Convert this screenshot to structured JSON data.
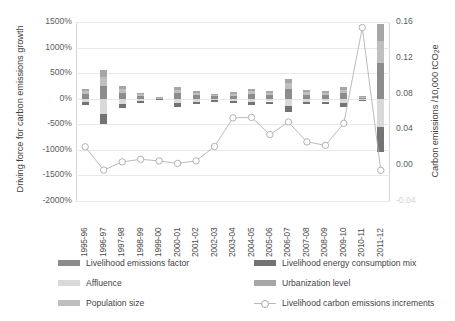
{
  "chart_data": {
    "type": "bar",
    "subtype": "stacked-bar-with-line",
    "title": "",
    "xlabel": "",
    "ylabel": "Driving force for carbon emissions growth",
    "y2label": "Carbon emissions /10,000 tCO2e",
    "grid": true,
    "legend_position": "bottom",
    "categories": [
      "1995-96",
      "1996-97",
      "1997-98",
      "1998-99",
      "1999-00",
      "2000-01",
      "2001-02",
      "2002-03",
      "2003-04",
      "2004-05",
      "2005-06",
      "2006-07",
      "2007-08",
      "2008-09",
      "2009-10",
      "2010-11",
      "2011-12"
    ],
    "ylim": [
      -2000,
      1500
    ],
    "yticks": [
      "-2000%",
      "-1500%",
      "-1000%",
      "-500%",
      "0%",
      "500%",
      "1000%",
      "1500%"
    ],
    "ytick_values": [
      -2000,
      -1500,
      -1000,
      -500,
      0,
      500,
      1000,
      1500
    ],
    "y2lim": [
      -0.04,
      0.16
    ],
    "y2ticks": [
      "-0.04",
      "0.00",
      "0.04",
      "0.08",
      "0.12",
      "0.16"
    ],
    "y2tick_values": [
      -0.04,
      0.0,
      0.04,
      0.08,
      0.12,
      0.16
    ],
    "series": [
      {
        "name": "Livelihood emissions factor",
        "type": "bar",
        "color": "#8c8c8c",
        "values": [
          90,
          250,
          120,
          55,
          15,
          120,
          70,
          45,
          60,
          95,
          75,
          190,
          80,
          75,
          110,
          25,
          700
        ]
      },
      {
        "name": "Affluence",
        "type": "bar",
        "color": "#d9d9d9",
        "values": [
          -70,
          -300,
          -95,
          -40,
          -10,
          -85,
          -60,
          -30,
          -45,
          -70,
          -55,
          -150,
          -60,
          -55,
          -85,
          -20,
          -560
        ]
      },
      {
        "name": "Population size",
        "type": "bar",
        "color": "#bfbfbf",
        "values": [
          55,
          180,
          70,
          30,
          8,
          60,
          45,
          25,
          35,
          50,
          40,
          110,
          45,
          40,
          65,
          15,
          420
        ]
      },
      {
        "name": "Livelihood energy consumption mix",
        "type": "bar",
        "color": "#737373",
        "values": [
          -60,
          -190,
          -80,
          -35,
          -9,
          -70,
          -50,
          -28,
          -40,
          -58,
          -45,
          -120,
          -50,
          -45,
          -70,
          -18,
          -480
        ]
      },
      {
        "name": "Urbanization level",
        "type": "bar",
        "color": "#a6a6a6",
        "values": [
          45,
          140,
          60,
          25,
          6,
          50,
          38,
          20,
          30,
          45,
          35,
          95,
          38,
          33,
          55,
          12,
          340
        ]
      },
      {
        "name": "Livelihood carbon emissions increments",
        "type": "line",
        "color": "#b3b3b3",
        "marker": "open-circle",
        "axis": "secondary",
        "values_percent": [
          -940,
          -1395,
          -1235,
          -1185,
          -1215,
          -1265,
          -1215,
          -935,
          -375,
          -365,
          -700,
          -455,
          -845,
          -910,
          -480,
          1390,
          -1400
        ],
        "values_secondary": [
          0.0045,
          -0.0015,
          0.0005,
          0.0012,
          0.0008,
          0.0002,
          0.0008,
          0.005,
          0.012,
          0.0122,
          0.0078,
          0.011,
          0.006,
          0.0053,
          0.0115,
          0.035,
          -0.0012
        ]
      }
    ]
  },
  "legend": {
    "items": [
      {
        "label": "Livelihood emissions factor",
        "swatch": "#8c8c8c",
        "kind": "swatch"
      },
      {
        "label": "Affluence",
        "swatch": "#d9d9d9",
        "kind": "swatch"
      },
      {
        "label": "Population size",
        "swatch": "#bfbfbf",
        "kind": "swatch"
      },
      {
        "label": "Livelihood energy consumption mix",
        "swatch": "#737373",
        "kind": "swatch"
      },
      {
        "label": "Urbanization level",
        "swatch": "#a6a6a6",
        "kind": "swatch"
      },
      {
        "label": "Livelihood carbon emissions increments",
        "swatch": "#b3b3b3",
        "kind": "line"
      }
    ]
  },
  "axes": {
    "left_title": "Driving force for carbon emissions growth",
    "right_title_main": "Carbon emissions /10,000 tCO",
    "right_title_sub": "2",
    "right_title_tail": "e"
  }
}
